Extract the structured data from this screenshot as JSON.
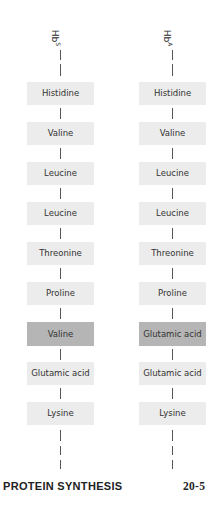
{
  "chains": [
    {
      "label": "Hb",
      "label_sup": "S",
      "residues": [
        "Histidine",
        "Valine",
        "Leucine",
        "Leucine",
        "Threonine",
        "Proline",
        "Valine",
        "Glutamic acid",
        "Lysine"
      ],
      "highlight_index": 6
    },
    {
      "label": "Hb",
      "label_sup": "A",
      "residues": [
        "Histidine",
        "Valine",
        "Leucine",
        "Leucine",
        "Threonine",
        "Proline",
        "Glutamic acid",
        "Glutamic acid",
        "Lysine"
      ],
      "highlight_index": 6
    }
  ],
  "colors": {
    "box": "#ececec",
    "highlight": "#b5b5b5",
    "line": "#555555"
  },
  "footer": {
    "title": "PROTEIN SYNTHESIS",
    "page": "20-5"
  }
}
